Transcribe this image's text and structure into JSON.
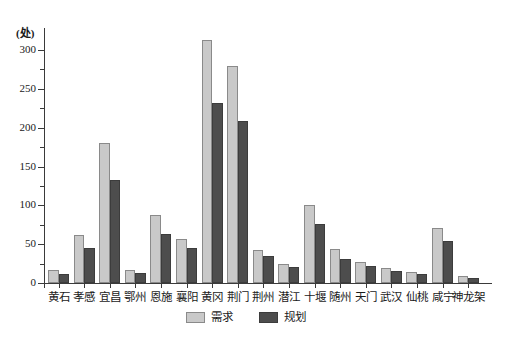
{
  "chart_data": {
    "type": "bar",
    "title": "",
    "subtitle": "",
    "xlabel": "",
    "ylabel": "",
    "unit_label": "(处)",
    "ylim": [
      0,
      320
    ],
    "yticks": [
      0,
      50,
      100,
      150,
      200,
      250,
      300
    ],
    "ytick_labels": [
      "0",
      "50",
      "100",
      "150",
      "200",
      "250",
      "300"
    ],
    "minor_ticks": [
      25,
      75,
      125,
      175,
      225,
      275
    ],
    "grid": false,
    "legend_position": "bottom-center",
    "categories": [
      "黄石",
      "孝感",
      "宜昌",
      "鄂州",
      "恩施",
      "襄阳",
      "黄冈",
      "荆门",
      "荆州",
      "潜江",
      "十堰",
      "随州",
      "天门",
      "武汉",
      "仙桃",
      "咸宁",
      "神龙架"
    ],
    "series": [
      {
        "name": "需求",
        "color": "#c9c9c9",
        "values": [
          17,
          62,
          180,
          17,
          88,
          57,
          313,
          280,
          43,
          25,
          101,
          44,
          27,
          19,
          14,
          71,
          9
        ]
      },
      {
        "name": "规划",
        "color": "#4d4d4d",
        "values": [
          12,
          45,
          132,
          13,
          63,
          45,
          232,
          209,
          35,
          20,
          76,
          31,
          22,
          15,
          11,
          54,
          7
        ]
      }
    ]
  },
  "legend": {
    "items": [
      {
        "label": "需求",
        "key": "demand"
      },
      {
        "label": "规划",
        "key": "plan"
      }
    ]
  }
}
